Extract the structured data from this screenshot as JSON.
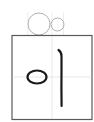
{
  "practice_card": {
    "character": "이",
    "guide": {
      "circle_large": {
        "cx": 39,
        "cy": 24,
        "r": 11
      },
      "circle_small": {
        "cx": 57,
        "cy": 24,
        "r": 6.5
      },
      "stroke_color": "#a8a8a8"
    },
    "box": {
      "x": 12,
      "y": 35,
      "width": 80,
      "height": 84,
      "border_color": "#555555",
      "grid_color": "#dcdcdc"
    },
    "ink_color": "#1a1a1a"
  }
}
